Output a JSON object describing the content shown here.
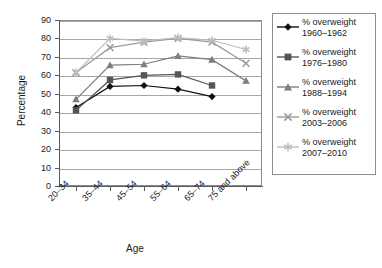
{
  "chart_data": {
    "type": "line",
    "title": "",
    "xlabel": "Age",
    "ylabel": "Percentage",
    "categories": [
      "20–34",
      "35–44",
      "45–54",
      "55–64",
      "65–74",
      "75 and above"
    ],
    "ylim": [
      0,
      90
    ],
    "ytick_step": 10,
    "yticks": [
      "90",
      "80",
      "70",
      "60",
      "50",
      "40",
      "30",
      "20",
      "10",
      "0"
    ],
    "grid": true,
    "legend_position": "right",
    "series": [
      {
        "name": "% overweight 1960–1962",
        "label_line1": "% overweight",
        "label_line2": "1960–1962",
        "marker": "diamond",
        "color": "#111111",
        "values": [
          42.5,
          54.0,
          54.5,
          52.5,
          48.5,
          null
        ]
      },
      {
        "name": "% overweight 1976–1980",
        "label_line1": "% overweight",
        "label_line2": "1976–1980",
        "marker": "square",
        "color": "#555555",
        "values": [
          41.0,
          57.5,
          60.0,
          60.5,
          54.5,
          null
        ]
      },
      {
        "name": "% overweight 1988–1994",
        "label_line1": "% overweight",
        "label_line2": "1988–1994",
        "marker": "triangle",
        "color": "#7d7d7d",
        "values": [
          47.0,
          65.5,
          66.0,
          70.5,
          68.5,
          57.0
        ]
      },
      {
        "name": "% overweight 2003–2006",
        "label_line1": "% overweight",
        "label_line2": "2003–2006",
        "marker": "x",
        "color": "#9a9a9a",
        "values": [
          61.5,
          75.0,
          78.0,
          80.0,
          78.0,
          66.5
        ]
      },
      {
        "name": "% overweight 2007–2010",
        "label_line1": "% overweight",
        "label_line2": "2007–2010",
        "marker": "asterisk",
        "color": "#bdbdbd",
        "values": [
          61.5,
          80.0,
          78.5,
          80.5,
          79.0,
          74.0
        ]
      }
    ]
  }
}
